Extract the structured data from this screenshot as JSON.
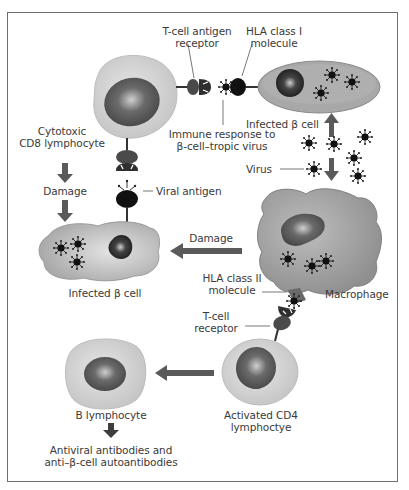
{
  "diagram": {
    "colors": {
      "border": "#6e6e6e",
      "cell_fill": "#c7c7c7",
      "cell_light": "#e2e2e2",
      "nucleus": "#555555",
      "arrow": "#5a5a5a",
      "receptor": "#4a4a4a",
      "virus": "#1a1a1a"
    },
    "labels": {
      "tcell_antigen_receptor": [
        "T-cell antigen",
        "receptor"
      ],
      "hla_class_1": [
        "HLA class I",
        "molecule"
      ],
      "infected_beta_cell_top": "Infected β cell",
      "immune_response": [
        "Immune response to",
        "β-cell–tropic virus"
      ],
      "cytotoxic_cd8": [
        "Cytotoxic",
        "CD8 lymphocyte"
      ],
      "damage_1": "Damage",
      "viral_antigen": "Viral antigen",
      "virus": "Virus",
      "damage_2": "Damage",
      "infected_beta_cell_left": "Infected β cell",
      "hla_class_2": [
        "HLA class II",
        "molecule"
      ],
      "macrophage": "Macrophage",
      "tcell_receptor": [
        "T-cell",
        "receptor"
      ],
      "b_lymphocyte": "B lymphocyte",
      "activated_cd4": [
        "Activated CD4",
        "lymphoctye"
      ],
      "antibodies": [
        "Antiviral antibodies and",
        "anti–β-cell autoantibodies"
      ]
    },
    "nodes": [
      {
        "id": "cd8-lymphocyte",
        "label": "Cytotoxic CD8 lymphocyte"
      },
      {
        "id": "infected-beta-cell-top",
        "label": "Infected β cell"
      },
      {
        "id": "virus",
        "label": "Virus"
      },
      {
        "id": "macrophage",
        "label": "Macrophage"
      },
      {
        "id": "infected-beta-cell-left",
        "label": "Infected β cell"
      },
      {
        "id": "activated-cd4",
        "label": "Activated CD4 lymphoctye"
      },
      {
        "id": "b-lymphocyte",
        "label": "B lymphocyte"
      },
      {
        "id": "antibodies",
        "label": "Antiviral antibodies and anti–β-cell autoantibodies"
      }
    ],
    "edges": [
      {
        "from": "virus",
        "to": "infected-beta-cell-top",
        "label": ""
      },
      {
        "from": "virus",
        "to": "macrophage",
        "label": ""
      },
      {
        "from": "macrophage",
        "to": "infected-beta-cell-left",
        "label": "Damage"
      },
      {
        "from": "cd8-lymphocyte",
        "to": "infected-beta-cell-left",
        "label": "Damage"
      },
      {
        "from": "activated-cd4",
        "to": "b-lymphocyte",
        "label": ""
      },
      {
        "from": "b-lymphocyte",
        "to": "antibodies",
        "label": ""
      }
    ]
  }
}
